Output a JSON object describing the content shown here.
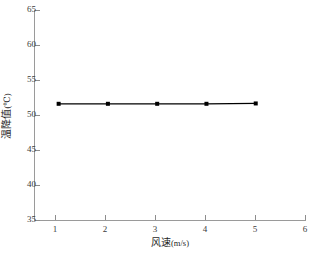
{
  "chart_data": {
    "type": "line",
    "title": "",
    "subtitle": "",
    "xlabel": "风速",
    "xlabel_unit": "(m/s)",
    "ylabel": "温降值",
    "ylabel_unit": "(℃)",
    "x": [
      1,
      2,
      3,
      4,
      5
    ],
    "xlim": [
      0.5,
      6
    ],
    "ylim": [
      35,
      65
    ],
    "x_ticks": [
      1,
      2,
      3,
      4,
      5,
      6
    ],
    "y_ticks": [
      35,
      40,
      45,
      50,
      55,
      60,
      65
    ],
    "grid": false,
    "legend": false,
    "legend_position": "none",
    "series": [
      {
        "name": "温降值",
        "values": [
          51.6,
          51.6,
          51.6,
          51.6,
          51.65
        ],
        "color": "#000000",
        "marker": "square",
        "marker_size": 4,
        "line_width": 1.2
      }
    ],
    "annotations": []
  },
  "axes": {
    "y_tick_labels": [
      "65",
      "60",
      "55",
      "50",
      "45",
      "40",
      "35"
    ],
    "x_tick_labels": [
      "1",
      "2",
      "3",
      "4",
      "5",
      "6"
    ]
  },
  "colors": {
    "background": "#ffffff",
    "axis": "#9a9a9a",
    "tick": "#8d8d8d",
    "text": "#1f1f1f",
    "series": "#000000"
  },
  "footer": {
    "note": ""
  }
}
